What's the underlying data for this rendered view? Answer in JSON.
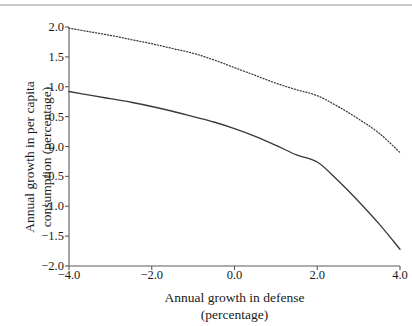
{
  "chart_data": {
    "type": "line",
    "title": "",
    "subtitle": "",
    "xlabel_line1": "Annual  growth  in  defense",
    "xlabel_line2": "(percentage)",
    "ylabel_line1": "Annual  growth  in  per  capita",
    "ylabel_line2": "consumption (percentage)",
    "xlim": [
      -4.0,
      4.0
    ],
    "ylim": [
      -2.0,
      2.0
    ],
    "xticks": [
      "-4.0",
      "-2.0",
      "0.0",
      "2.0",
      "4.0"
    ],
    "xtick_values": [
      -4.0,
      -2.0,
      0.0,
      2.0,
      4.0
    ],
    "yticks": [
      "2.0",
      "1.5",
      "1.0",
      "0.5",
      "0.0",
      "-0.5",
      "-1.0",
      "-1.5",
      "-2.0"
    ],
    "ytick_values": [
      2.0,
      1.5,
      1.0,
      0.5,
      0.0,
      -0.5,
      -1.0,
      -1.5,
      -2.0
    ],
    "grid": false,
    "legend": "none",
    "axis_color": "#5a5a5a",
    "series": [
      {
        "name": "upper-dotted-curve",
        "style": "dotted",
        "color": "#3a3a3a",
        "x": [
          -4.0,
          -3.5,
          -3.0,
          -2.5,
          -2.0,
          -1.5,
          -1.0,
          -0.5,
          0.0,
          0.5,
          1.0,
          1.5,
          2.0,
          2.5,
          3.0,
          3.5,
          4.0
        ],
        "values": [
          1.98,
          1.92,
          1.86,
          1.79,
          1.72,
          1.64,
          1.56,
          1.45,
          1.32,
          1.19,
          1.06,
          0.95,
          0.85,
          0.67,
          0.46,
          0.22,
          -0.1
        ]
      },
      {
        "name": "lower-solid-curve",
        "style": "solid",
        "color": "#3a3a3a",
        "x": [
          -4.0,
          -3.5,
          -3.0,
          -2.5,
          -2.0,
          -1.5,
          -1.0,
          -0.5,
          0.0,
          0.5,
          1.0,
          1.5,
          2.0,
          2.5,
          3.0,
          3.5,
          4.0
        ],
        "values": [
          0.92,
          0.86,
          0.8,
          0.74,
          0.67,
          0.59,
          0.5,
          0.41,
          0.3,
          0.17,
          0.02,
          -0.14,
          -0.26,
          -0.57,
          -0.92,
          -1.3,
          -1.72
        ]
      }
    ]
  },
  "figure": {
    "top_rule": "horizontal-rule"
  }
}
